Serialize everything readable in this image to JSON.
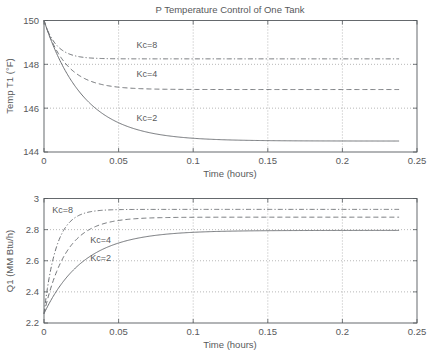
{
  "figure": {
    "title": "P Temperature Control of One Tank",
    "background": "#ffffff",
    "line_color": "#6f7276",
    "axis_color": "#555a5e",
    "grid_color": "#9a9a9a",
    "text_color": "#58595b"
  },
  "chart_data": [
    {
      "type": "line",
      "title": "P Temperature Control of One Tank",
      "xlabel": "Time (hours)",
      "ylabel": "Temp T1 (°F)",
      "xlim": [
        0,
        0.25
      ],
      "ylim": [
        144,
        150
      ],
      "xticks": [
        0,
        0.05,
        0.1,
        0.15,
        0.2,
        0.25
      ],
      "xticklabels": [
        "0",
        "0.05",
        "0.1",
        "0.15",
        "0.2",
        "0.25"
      ],
      "yticks": [
        144,
        146,
        148,
        150
      ],
      "yticklabels": [
        "144",
        "146",
        "148",
        "150"
      ],
      "grid": true,
      "legend": "inline-annotations",
      "x_data_max": 0.238,
      "series": [
        {
          "name": "Kc=2",
          "label": "Kc=2",
          "linestyle": "solid",
          "label_x": 0.062,
          "label_y": 145.55,
          "y0": 150.0,
          "yinf": 144.5,
          "tau": 0.0265
        },
        {
          "name": "Kc=4",
          "label": "Kc=4",
          "linestyle": "dashed",
          "label_x": 0.062,
          "label_y": 147.55,
          "y0": 150.0,
          "yinf": 146.85,
          "tau": 0.0148
        },
        {
          "name": "Kc=8",
          "label": "Kc=8",
          "linestyle": "dashdot",
          "label_x": 0.062,
          "label_y": 148.9,
          "y0": 150.0,
          "yinf": 148.25,
          "tau": 0.0082
        }
      ]
    },
    {
      "type": "line",
      "title": "",
      "xlabel": "Time (hours)",
      "ylabel": "Q1 (MM Btu/h)",
      "xlim": [
        0,
        0.25
      ],
      "ylim": [
        2.2,
        3.0
      ],
      "xticks": [
        0,
        0.05,
        0.1,
        0.15,
        0.2,
        0.25
      ],
      "xticklabels": [
        "0",
        "0.05",
        "0.1",
        "0.15",
        "0.2",
        "0.25"
      ],
      "yticks": [
        2.2,
        2.4,
        2.6,
        2.8,
        3.0
      ],
      "yticklabels": [
        "2.2",
        "2.4",
        "2.6",
        "2.8",
        "3"
      ],
      "grid": true,
      "legend": "inline-annotations",
      "x_data_max": 0.238,
      "series": [
        {
          "name": "Kc=2",
          "label": "Kc=2",
          "linestyle": "solid",
          "label_x": 0.031,
          "label_y": 2.617,
          "y0": 2.26,
          "yinf": 2.795,
          "tau": 0.0265
        },
        {
          "name": "Kc=4",
          "label": "Kc=4",
          "linestyle": "dashed",
          "label_x": 0.031,
          "label_y": 2.735,
          "y0": 2.26,
          "yinf": 2.88,
          "tau": 0.0148
        },
        {
          "name": "Kc=8",
          "label": "Kc=8",
          "linestyle": "dashdot",
          "label_x": 0.0055,
          "label_y": 2.925,
          "y0": 2.26,
          "yinf": 2.93,
          "tau": 0.0082
        }
      ]
    }
  ]
}
